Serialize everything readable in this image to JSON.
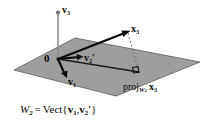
{
  "figure": {
    "type": "vector-projection-diagram",
    "background_color": "#ffffff",
    "plane_color": "#9e9e9e",
    "plane_edge_color": "#4a4a4a",
    "vector_color": "#0a0a0a",
    "axis_color": "#8c8c8c",
    "dashed_color": "#7a7a7a"
  },
  "labels": {
    "origin": "0",
    "v3": {
      "name": "v",
      "sub": "3"
    },
    "x3": {
      "name": "x",
      "sub": "3"
    },
    "v2prime": {
      "name": "v",
      "sub": "2",
      "prime": "′"
    },
    "v1": {
      "name": "v",
      "sub": "1"
    },
    "projection": {
      "op": "proj",
      "sub_space": "W",
      "sub_space_index": "2",
      "arg": "x",
      "arg_sub": "3"
    },
    "caption": {
      "space": "W",
      "space_sub": "2",
      "equals": "=",
      "operator": "Vect",
      "open": "{",
      "gen1": "v",
      "gen1_sub": "1",
      "comma": ",",
      "gen2": "v",
      "gen2_sub": "2",
      "gen2_prime": "′",
      "close": "}"
    }
  },
  "geometry": {
    "origin_point": [
      58,
      59
    ],
    "x3_point": [
      128,
      31
    ],
    "projection_point": [
      139,
      71
    ],
    "v2prime_tip": [
      82,
      57
    ],
    "v1_tip": [
      66,
      76
    ],
    "v3_tip": [
      58,
      12
    ],
    "plane_polygon": "14,70 75,38 200,62 116,96",
    "right_angle_marker": true
  }
}
